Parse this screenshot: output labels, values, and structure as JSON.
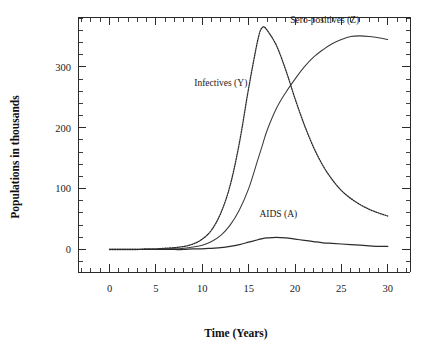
{
  "chart_data": {
    "type": "line",
    "title": "",
    "xlabel": "Time (Years)",
    "ylabel": "Populations in thousands",
    "xlim": [
      -3.4,
      32.4
    ],
    "ylim": [
      -37,
      382
    ],
    "grid": false,
    "legend_position": "inline-annotations",
    "xticks": [
      0,
      5,
      10,
      15,
      20,
      25,
      30
    ],
    "xtick_labels": [
      "0",
      "5",
      "10",
      "15",
      "20",
      "25",
      "30"
    ],
    "x_minor_tick_step": 1,
    "yticks": [
      0,
      100,
      200,
      300
    ],
    "ytick_labels": [
      "0",
      "100",
      "200",
      "300"
    ],
    "y_minor_tick_step": 20,
    "x": [
      0,
      1,
      2,
      3,
      4,
      5,
      6,
      7,
      8,
      9,
      10,
      11,
      12,
      13,
      14,
      15,
      16,
      16.5,
      17,
      18,
      19,
      20,
      21,
      22,
      23,
      24,
      25,
      26,
      27,
      28,
      29,
      30
    ],
    "series": [
      {
        "name": "Infectives (Y)",
        "label": "Infectives (Y)",
        "style": "dotted",
        "color": "#2b2b2b",
        "values": [
          0,
          0,
          0,
          0,
          1,
          1,
          2,
          3,
          5,
          9,
          17,
          32,
          60,
          105,
          175,
          265,
          345,
          365,
          360,
          335,
          295,
          248,
          205,
          168,
          138,
          115,
          97,
          84,
          74,
          66,
          60,
          55
        ],
        "annotation": {
          "text": "Infectives (Y)",
          "x": 12.0,
          "y": 268
        }
      },
      {
        "name": "Sero-positives (Z)",
        "label": "Sero-positives (Z)",
        "style": "solid-thin",
        "color": "#3a3a3a",
        "values": [
          0,
          0,
          0,
          0,
          0,
          0,
          1,
          1,
          2,
          4,
          7,
          13,
          23,
          40,
          65,
          100,
          148,
          172,
          196,
          232,
          258,
          280,
          300,
          316,
          328,
          338,
          345,
          350,
          351,
          350,
          348,
          345
        ],
        "annotation": {
          "text": "Sero-positives (Z)",
          "x": 23.2,
          "y": 372
        }
      },
      {
        "name": "AIDS (A)",
        "label": "AIDS (A)",
        "style": "solid",
        "color": "#2b2b2b",
        "values": [
          0,
          0,
          0,
          0,
          0,
          0,
          0,
          0,
          0,
          1,
          1,
          2,
          3,
          5,
          8,
          12,
          16,
          18,
          19,
          20,
          19,
          17,
          15,
          13,
          11,
          10,
          9,
          8,
          7,
          6,
          5,
          5
        ],
        "annotation": {
          "text": "AIDS (A)",
          "x": 18.2,
          "y": 53
        }
      }
    ]
  },
  "axes": {
    "y_title": "Populations in thousands",
    "x_title": "Time (Years)"
  },
  "colors": {
    "background": "#ffffff",
    "axis": "#2a2a2a",
    "text": "#1a1a1a",
    "curve": "#2b2b2b"
  }
}
